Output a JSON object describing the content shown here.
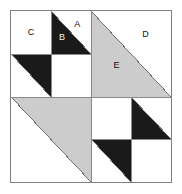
{
  "figure": {
    "kind": "geometric-quilt-block",
    "canvas": {
      "width": 182,
      "height": 194
    },
    "block": {
      "left": 10,
      "top": 10,
      "width": 162,
      "height": 173
    }
  },
  "colors": {
    "background": "#ffffff",
    "white_fill": "#ffffff",
    "gray_fill": "#cccccc",
    "black_fill": "#1a1a1a",
    "outline": "#808080",
    "gridline": "#8a8a8a",
    "label_on_light": "#111111",
    "label_on_dark": "#f2f2f2"
  },
  "labels": {
    "a": "A",
    "b": "B",
    "c": "C",
    "d": "D",
    "e": "E"
  },
  "regions": [
    {
      "id": "C",
      "label": "C",
      "quadrant": "top-left",
      "cell": "top-left",
      "shape": "square",
      "fill": "white"
    },
    {
      "id": "A",
      "label": "A",
      "quadrant": "top-left",
      "cell": "top-right",
      "shape": "triangle",
      "orientation": "upper-right",
      "fill": "white"
    },
    {
      "id": "B",
      "label": "B",
      "quadrant": "top-left",
      "cell": "top-right",
      "shape": "triangle",
      "orientation": "lower-left",
      "fill": "black"
    },
    {
      "id": "tl-bottom-left-dark",
      "label": "",
      "quadrant": "top-left",
      "cell": "bottom-left",
      "shape": "triangle",
      "orientation": "upper-right",
      "fill": "black"
    },
    {
      "id": "tl-bottom-right",
      "label": "",
      "quadrant": "top-left",
      "cell": "bottom-right",
      "shape": "square",
      "fill": "white"
    },
    {
      "id": "D",
      "label": "D",
      "quadrant": "top-right",
      "cell": "full",
      "shape": "triangle",
      "orientation": "upper-right",
      "fill": "white"
    },
    {
      "id": "E",
      "label": "E",
      "quadrant": "top-right",
      "cell": "full",
      "shape": "triangle",
      "orientation": "lower-left",
      "fill": "gray"
    },
    {
      "id": "bl-gray",
      "label": "",
      "quadrant": "bottom-left",
      "cell": "full",
      "shape": "triangle",
      "orientation": "upper-right",
      "fill": "gray"
    },
    {
      "id": "bl-white",
      "label": "",
      "quadrant": "bottom-left",
      "cell": "full",
      "shape": "triangle",
      "orientation": "lower-left",
      "fill": "white"
    },
    {
      "id": "br-top-left",
      "label": "",
      "quadrant": "bottom-right",
      "cell": "top-left",
      "shape": "square",
      "fill": "white"
    },
    {
      "id": "br-top-right-dark",
      "label": "",
      "quadrant": "bottom-right",
      "cell": "top-right",
      "shape": "triangle",
      "orientation": "lower-left",
      "fill": "black"
    },
    {
      "id": "br-bottom-left-dark",
      "label": "",
      "quadrant": "bottom-right",
      "cell": "bottom-left",
      "shape": "triangle",
      "orientation": "upper-right",
      "fill": "black"
    },
    {
      "id": "br-bottom-right",
      "label": "",
      "quadrant": "bottom-right",
      "cell": "bottom-right",
      "shape": "square",
      "fill": "white"
    }
  ]
}
